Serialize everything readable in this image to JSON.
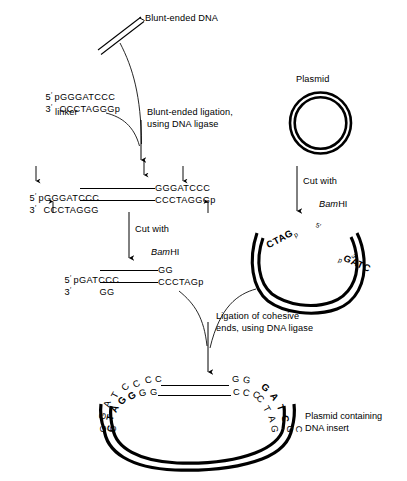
{
  "figure": {
    "title_not_shown": "",
    "background": "#ffffff",
    "ink": "#000000"
  },
  "top": {
    "blunt_dna_label": "Blunt-ended DNA",
    "plasmid_label": "Plasmid"
  },
  "linker": {
    "five_prime": "5",
    "prime_mark": "′",
    "top_strand": "pGGGATCCC",
    "three_prime": "3",
    "bottom_strand": "CCCTAGGGp",
    "name": "linker"
  },
  "steps": {
    "blunt_ligation_line1": "Blunt-ended ligation,",
    "blunt_ligation_line2": "using DNA ligase",
    "cut_line1": "Cut with",
    "cut_enzyme_italic": "Bam",
    "cut_enzyme_rest": "HI",
    "cut_right_line1": "Cut with",
    "ligation_line1": "Ligation of cohesive",
    "ligation_line2": "ends, using DNA ligase"
  },
  "ligated": {
    "five_prime": "5",
    "three_prime": "3",
    "top_left": "pGGGATCCC",
    "top_right": "GGGATCCC",
    "bottom_left": "CCCTAGGG",
    "bottom_right": "CCCTAGGGp"
  },
  "cut_product": {
    "five_prime": "5",
    "three_prime": "3",
    "top_left": "pGATCCC",
    "top_right": "GG",
    "bottom_left": "GG",
    "bottom_right": "CCCTAGp"
  },
  "cut_plasmid": {
    "left_end": "CTAG",
    "left_end_sub": "p",
    "right_five_prime": "5′",
    "right_p": "p",
    "right_end": "GATC",
    "right_three_prime": "3′"
  },
  "final": {
    "caption_line1": "Plasmid containing",
    "caption_line2": "DNA insert",
    "top_strand_left": [
      "C",
      "C",
      "C"
    ],
    "bottom_strand_left": [
      "G",
      "G",
      "G"
    ],
    "top_strand_right": [
      "G",
      "G"
    ],
    "bottom_strand_right": [
      "C",
      "C",
      "C"
    ],
    "left_arc_outer": [
      "G",
      "A",
      "T",
      "C"
    ],
    "left_arc_inner_bold": [
      "C",
      "T",
      "A",
      "G"
    ],
    "right_arc_outer_bold": [
      "G",
      "A",
      "T",
      "C"
    ],
    "right_arc_inner": [
      "C",
      "T",
      "A",
      "G"
    ],
    "left_tail_outer": [
      "G",
      "C"
    ],
    "right_tail_outer": [
      "G",
      "C"
    ]
  }
}
